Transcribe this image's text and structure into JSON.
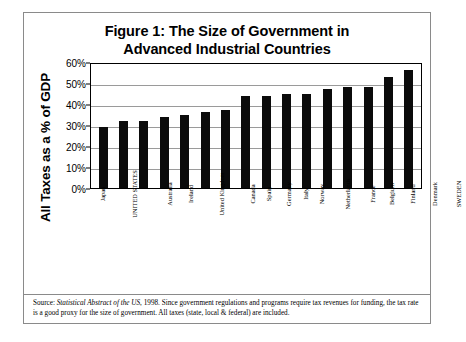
{
  "figure": {
    "title_line1": "Figure 1: The Size of Government in",
    "title_line2": "Advanced Industrial Countries",
    "y_axis_title": "All Taxes as a % of GDP",
    "source_prefix": "Source: ",
    "source_italic": "Statistical Abstract of the US",
    "source_rest": ", 1998.  Since government regulations and programs require tax revenues for funding, the tax rate is a good proxy for the size of government.  All taxes (state, local & federal) are included."
  },
  "chart_data": {
    "type": "bar",
    "title": "Figure 1: The Size of Government in Advanced Industrial Countries",
    "xlabel": "",
    "ylabel": "All Taxes as a % of GDP",
    "ylim": [
      0,
      60
    ],
    "ytick_labels": [
      "60%",
      "50%",
      "40%",
      "30%",
      "20%",
      "10%",
      "0%"
    ],
    "ytick_values": [
      60,
      50,
      40,
      30,
      20,
      10,
      0
    ],
    "grid": true,
    "legend": "none",
    "bar_color": "#0b0b0b",
    "categories": [
      "Japan",
      "UNITED STATES",
      "Australia",
      "Ireland",
      "United Kingdom",
      "Canada",
      "Spain",
      "Germany",
      "Italy",
      "Norway",
      "Netherlands",
      "France",
      "Belgium",
      "Finland",
      "Denmark",
      "SWEDEN"
    ],
    "values": [
      29,
      32,
      32,
      34,
      35,
      36,
      37,
      44,
      44,
      45,
      45,
      47,
      48,
      48,
      53,
      56
    ]
  }
}
